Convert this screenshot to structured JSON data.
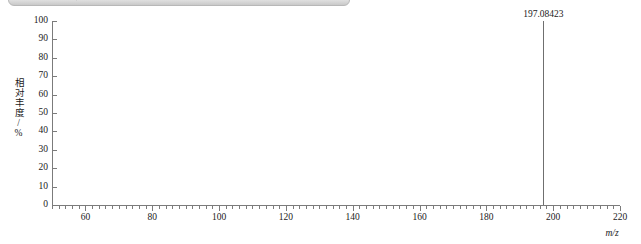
{
  "window": {
    "scrollbar": {
      "name": "horizontal-scrollbar-thumb",
      "color": "#d2d2d2"
    }
  },
  "chart_data": {
    "type": "bar",
    "title": "",
    "subtitle": "",
    "xlabel": "m/z",
    "ylabel": "相对丰度/%",
    "xlim": [
      50,
      220
    ],
    "ylim": [
      0,
      100
    ],
    "grid": false,
    "legend": null,
    "x_major_ticks": [
      60,
      80,
      100,
      120,
      140,
      160,
      180,
      200,
      220
    ],
    "x_major_tick_labels": [
      "60",
      "80",
      "100",
      "120",
      "140",
      "160",
      "180",
      "200",
      "220"
    ],
    "x_minor_tick_step": 2,
    "y_ticks": [
      0,
      10,
      20,
      30,
      40,
      50,
      60,
      70,
      80,
      90,
      100
    ],
    "y_tick_labels": [
      "0",
      "10",
      "20",
      "30",
      "40",
      "50",
      "60",
      "70",
      "80",
      "90",
      "100"
    ],
    "series": [
      {
        "name": "mass-spectrum",
        "color": "#6f6f6f",
        "points": [
          {
            "mz": 197.08423,
            "intensity": 100,
            "label": "197.08423"
          }
        ]
      }
    ],
    "annotations": [
      {
        "text": "197.08423",
        "mz": 197.08423,
        "intensity": 100
      }
    ]
  }
}
